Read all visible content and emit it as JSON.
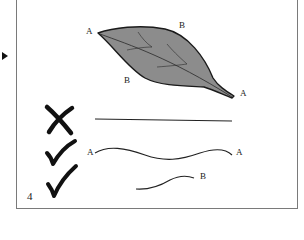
{
  "diagram": {
    "panel_number": "4",
    "marker": "play-triangle",
    "leaf": {
      "labels": {
        "tip": "A",
        "top_margin": "B",
        "bottom_margin": "B",
        "base": "A"
      },
      "fill_color": "#8c8c8c",
      "outline_color": "#1a1a1a"
    },
    "rows": [
      {
        "mark": "cross",
        "line": "straight",
        "start_label": "",
        "end_label": ""
      },
      {
        "mark": "check",
        "line": "wavy",
        "start_label": "A",
        "end_label": "A"
      },
      {
        "mark": "check",
        "line": "short-curve",
        "start_label": "",
        "end_label": "B"
      }
    ]
  }
}
